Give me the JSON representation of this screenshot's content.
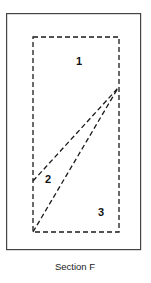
{
  "figure": {
    "caption": "Section F",
    "background_color": "#ffffff",
    "frame": {
      "name": "outer-frame",
      "style": "solid",
      "stroke_color": "#444444",
      "stroke_width": 1.2,
      "x": 6,
      "y": 13,
      "width": 135,
      "height": 237
    },
    "boundary": {
      "name": "dashed-boundary-rectangle",
      "style": "dashed",
      "stroke_color": "#1a1a1a",
      "stroke_width": 1.3,
      "dash_pattern": "5 3",
      "x": 33,
      "y": 37,
      "width": 86,
      "height": 195
    },
    "dividers": [
      {
        "name": "upper-divider-line",
        "style": "dashed",
        "from_x": 33,
        "from_y": 181,
        "to_x": 118,
        "to_y": 88
      },
      {
        "name": "lower-divider-line",
        "style": "dashed",
        "from_x": 33,
        "from_y": 232,
        "to_x": 118,
        "to_y": 88
      }
    ],
    "regions": [
      {
        "id": "1",
        "label": "1",
        "x": 79,
        "y": 62
      },
      {
        "id": "2",
        "label": "2",
        "x": 48,
        "y": 180
      },
      {
        "id": "3",
        "label": "3",
        "x": 101,
        "y": 213
      }
    ],
    "caption_position": {
      "x": 75,
      "y": 267
    }
  }
}
